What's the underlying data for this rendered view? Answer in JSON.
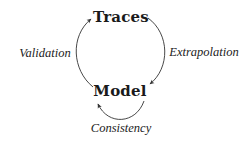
{
  "diagram": {
    "type": "cycle",
    "nodes": [
      {
        "id": "traces",
        "label": "Traces"
      },
      {
        "id": "model",
        "label": "Model"
      }
    ],
    "edges": [
      {
        "from": "traces",
        "to": "model",
        "label": "Extrapolation"
      },
      {
        "from": "model",
        "to": "traces",
        "label": "Validation"
      },
      {
        "from": "model",
        "to": "model",
        "label": "Consistency"
      }
    ]
  },
  "colors": {
    "background": "#ffffff",
    "stroke": "#333333",
    "text": "#1a1a1a"
  }
}
